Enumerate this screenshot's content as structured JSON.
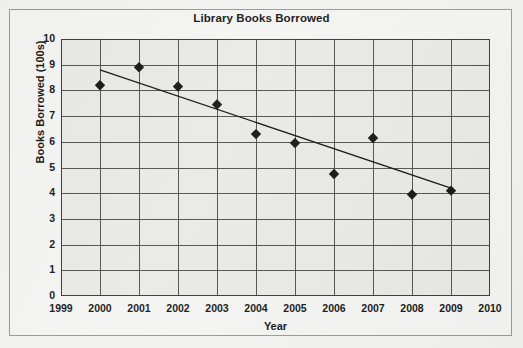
{
  "chart_data": {
    "type": "scatter",
    "title": "Library Books Borrowed",
    "xlabel": "Year",
    "ylabel": "Books Borrowed  (100s)",
    "x": [
      2000,
      2001,
      2002,
      2003,
      2004,
      2005,
      2006,
      2007,
      2008,
      2009
    ],
    "values": [
      8.2,
      8.9,
      8.15,
      7.45,
      6.3,
      5.95,
      4.75,
      6.15,
      3.95,
      4.1
    ],
    "series": [
      {
        "name": "Books Borrowed",
        "marker": "diamond",
        "color": "#1a1a1a",
        "values": [
          8.2,
          8.9,
          8.15,
          7.45,
          6.3,
          5.95,
          4.75,
          6.15,
          3.95,
          4.1
        ]
      }
    ],
    "trendline": {
      "name": "line of best fit",
      "color": "#1a1a1a",
      "x_start": 2000,
      "y_start": 8.8,
      "x_end": 2009,
      "y_end": 4.2
    },
    "xlim": [
      1999,
      2010
    ],
    "ylim": [
      0,
      10
    ],
    "xticks": [
      "1999",
      "2000",
      "2001",
      "2002",
      "2003",
      "2004",
      "2005",
      "2006",
      "2007",
      "2008",
      "2009",
      "2010"
    ],
    "yticks": [
      "10",
      "9",
      "8",
      "7",
      "6",
      "5",
      "4",
      "3",
      "2",
      "1",
      "0"
    ],
    "grid": "both",
    "legend": "none",
    "plot_bg": "#e9e9e7",
    "grid_color": "#555555",
    "frame_color": "#9a9a97"
  }
}
